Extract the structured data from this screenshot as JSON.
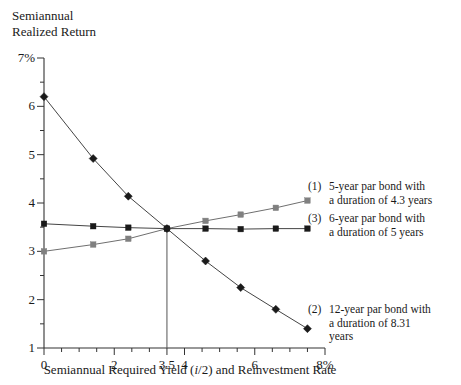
{
  "axes": {
    "y_title": "Semiannual\nRealized Return",
    "x_title_pre": "Semiannual Required Yield (",
    "x_title_ital": "i",
    "x_title_post": "/2) and Reinvestment Rate",
    "y_ticks": [
      "7%",
      "6",
      "5",
      "4",
      "3",
      "2",
      "1"
    ],
    "x_ticks": [
      "0",
      "2",
      "3.5",
      "4",
      "6",
      "8%"
    ]
  },
  "legend": [
    {
      "number": "(1)",
      "text": "5-year par bond with\na duration of 4.3 years"
    },
    {
      "number": "(3)",
      "text": "6-year par bond with\na duration of 5 years"
    },
    {
      "number": "(2)",
      "text": "12-year par bond with\na duration of 8.31\nyears"
    }
  ],
  "colors": {
    "axis": "#333333",
    "series1": "#808080",
    "series2": "#1a1a1a",
    "series3": "#1a1a1a",
    "refline": "#555555"
  },
  "chart_data": {
    "type": "line",
    "title": "",
    "xlabel": "Semiannual Required Yield (i/2) and Reinvestment Rate",
    "ylabel": "Semiannual Realized Return",
    "xlim": [
      0,
      8
    ],
    "ylim": [
      1,
      7
    ],
    "xticks": [
      0,
      2,
      3.5,
      4,
      6,
      8
    ],
    "yticks": [
      1,
      2,
      3,
      4,
      5,
      6,
      7
    ],
    "grid": false,
    "legend_position": "right",
    "annotations": [
      {
        "type": "vline",
        "x": 3.5,
        "label": "3.5",
        "from_y": 1,
        "to_y": 3.47
      }
    ],
    "series": [
      {
        "name": "(1) 5-year par bond with a duration of 4.3 years",
        "marker": "square",
        "color": "#808080",
        "x": [
          0,
          1.4,
          2.4,
          3.5,
          4.6,
          5.6,
          6.6,
          7.5
        ],
        "y": [
          3.0,
          3.14,
          3.26,
          3.47,
          3.63,
          3.76,
          3.9,
          4.05
        ]
      },
      {
        "name": "(2) 12-year par bond with a duration of 8.31 years",
        "marker": "diamond",
        "color": "#1a1a1a",
        "x": [
          0,
          1.4,
          2.4,
          3.5,
          4.6,
          5.6,
          6.6,
          7.5
        ],
        "y": [
          6.2,
          4.92,
          4.14,
          3.47,
          2.8,
          2.25,
          1.8,
          1.4
        ]
      },
      {
        "name": "(3) 6-year par bond with a duration of 5 years",
        "marker": "square",
        "color": "#1a1a1a",
        "x": [
          0,
          1.4,
          2.4,
          3.5,
          4.6,
          5.6,
          6.6,
          7.5
        ],
        "y": [
          3.57,
          3.52,
          3.49,
          3.47,
          3.47,
          3.46,
          3.47,
          3.47
        ]
      }
    ]
  }
}
